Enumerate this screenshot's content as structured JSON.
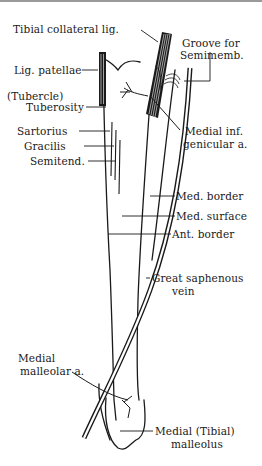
{
  "figure": {
    "labels": {
      "tibial_collateral_lig": "Tibial collateral lig.",
      "groove_line1": "Groove for",
      "groove_line2": "Semimemb.",
      "lig_patellae": "Lig. patellae",
      "tubercle": "(Tubercle)",
      "tuberosity": "Tuberosity",
      "sartorius": "Sartorius",
      "gracilis": "Gracilis",
      "semitend": "Semitend.",
      "med_inf_gen_line1": "Medial inf.",
      "med_inf_gen_line2": "genicular a.",
      "med_border": "Med. border",
      "med_surface": "Med. surface",
      "ant_border": "Ant. border",
      "saphenous_line1": "Great saphenous",
      "saphenous_line2": "vein",
      "malleolar_line1": "Medial",
      "malleolar_line2": "malleolar a.",
      "malleolus_line1": "Medial (Tibial)",
      "malleolus_line2": "malleolus"
    },
    "colors": {
      "ink": "#1a1a1a",
      "background": "#ffffff"
    }
  }
}
